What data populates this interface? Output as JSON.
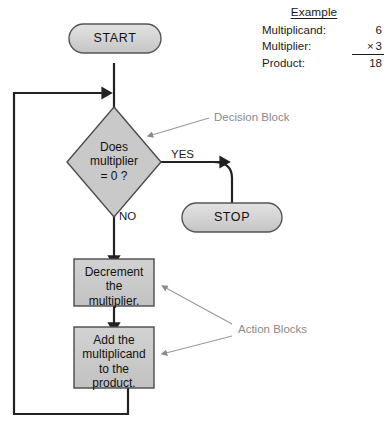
{
  "figure": {
    "kind": "flowchart"
  },
  "example": {
    "title": "Example",
    "rows": [
      {
        "label": "Multiplicand:",
        "value": "6",
        "ruled": false
      },
      {
        "label": "Multiplier:",
        "operator": "×",
        "value": "3",
        "ruled": true
      },
      {
        "label": "Product:",
        "value": "18",
        "ruled": false
      }
    ]
  },
  "flowchart": {
    "nodes": {
      "start": {
        "label": "START",
        "shape": "terminator",
        "fill": "#d4d4d4"
      },
      "decision": {
        "label": "Does\nmultiplier\n= 0 ?",
        "shape": "diamond",
        "fill": "#c9c9c9"
      },
      "stop": {
        "label": "STOP",
        "shape": "terminator",
        "fill": "#d4d4d4"
      },
      "decrement": {
        "label": "Decrement\nthe\nmultiplier.",
        "shape": "rectangle",
        "fill": "#c9c9c9"
      },
      "add": {
        "label": "Add the\nmultiplicand\nto the\nproduct.",
        "shape": "rectangle",
        "fill": "#c9c9c9"
      }
    },
    "edge_labels": {
      "yes": "YES",
      "no": "NO"
    },
    "callouts": {
      "decision_block": "Decision Block",
      "action_blocks": "Action Blocks"
    },
    "colors": {
      "line": "#222222",
      "callout": "#8a8a8a",
      "node_fill": "#c9c9c9",
      "node_stroke": "#4a4a4a"
    }
  }
}
